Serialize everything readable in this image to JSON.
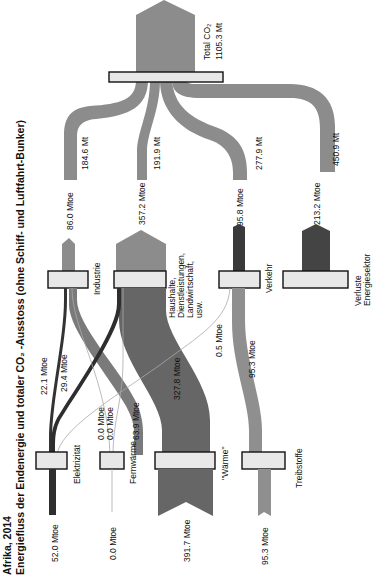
{
  "title": {
    "line1": "Afrika, 2014",
    "line2": "Energiefluss der Endenergie und totaler CO₂ -Ausstoss (ohne Schiff- und Luftfahrt-Bunker)"
  },
  "colors": {
    "co2_flow": "#8c8c8c",
    "electricity": "#333333",
    "heat": "#666666",
    "fuel": "#8f8f8f",
    "losses": "#444444",
    "thin_lines": "#aaaaaa",
    "node_fill": "#e8e8e8",
    "node_stroke": "#111111"
  },
  "total": {
    "label": "Total CO₂",
    "value": "1105.3 Mt"
  },
  "sources": [
    {
      "name": "Elektrizität",
      "value": "52.0 Mtoe"
    },
    {
      "name": "Fernwärme",
      "value": "0.0 Mtoe"
    },
    {
      "name": "\"Wärme\"",
      "value": "391.7 Mtoe"
    },
    {
      "name": "Treibstoffe",
      "value": "95.3 Mtoe"
    }
  ],
  "sectors": [
    {
      "name": "Industrie",
      "energy": "86.0 Mtoe",
      "co2": "184.6 Mt"
    },
    {
      "name": "Haushalte, Dienstleistungen, Landwirtschaft, usw.",
      "name_lines": [
        "Haushalte,",
        "Dienstleistungen,",
        "Landwirtschaft,",
        "usw."
      ],
      "energy": "357.2 Mtoe",
      "co2": "191.9 Mt"
    },
    {
      "name": "Verkehr",
      "energy": "95.8 Mtoe",
      "co2": "277.9 Mt"
    },
    {
      "name": "Verluste Energiesektor",
      "name_lines": [
        "Verluste",
        "Energiesektor"
      ],
      "energy": "213.2 Mtoe",
      "co2": "450.9 Mt"
    }
  ],
  "flows": [
    {
      "from": "Elektrizität",
      "to": "Industrie",
      "value": "22.1 Mtoe"
    },
    {
      "from": "Elektrizität",
      "to": "Haushalte",
      "value": "29.4 Mtoe"
    },
    {
      "from": "Elektrizität",
      "to": "Verkehr",
      "value": "0.5 Mtoe"
    },
    {
      "from": "Fernwärme",
      "to": "Industrie",
      "value": "0.0 Mtoe"
    },
    {
      "from": "Fernwärme",
      "to": "Haushalte",
      "value": "0.0 Mtoe"
    },
    {
      "from": "\"Wärme\"",
      "to": "Industrie",
      "value": "63.9 Mtoe"
    },
    {
      "from": "\"Wärme\"",
      "to": "Haushalte",
      "value": "327.8 Mtoe"
    },
    {
      "from": "Treibstoffe",
      "to": "Verkehr",
      "value": "95.3 Mtoe"
    }
  ]
}
